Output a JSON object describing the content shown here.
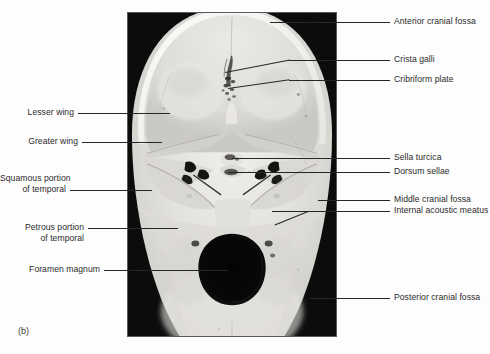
{
  "figure": {
    "caption": "(b)",
    "image_name": "skull-interior-cranial-base-superior-view"
  },
  "labels_right": [
    {
      "text": "Anterior cranial fossa",
      "name": "label-anterior-cranial-fossa"
    },
    {
      "text": "Crista galli",
      "name": "label-crista-galli"
    },
    {
      "text": "Cribriform plate",
      "name": "label-cribriform-plate"
    },
    {
      "text": "Sella turcica",
      "name": "label-sella-turcica"
    },
    {
      "text": "Dorsum sellae",
      "name": "label-dorsum-sellae"
    },
    {
      "text": "Middle cranial fossa",
      "name": "label-middle-cranial-fossa"
    },
    {
      "text": "Internal acoustic meatus",
      "name": "label-internal-acoustic-meatus"
    },
    {
      "text": "Posterior cranial fossa",
      "name": "label-posterior-cranial-fossa"
    }
  ],
  "labels_left": [
    {
      "line1": "Lesser wing",
      "line2": "",
      "name": "label-lesser-wing"
    },
    {
      "line1": "Greater wing",
      "line2": "",
      "name": "label-greater-wing"
    },
    {
      "line1": "Squamous portion",
      "line2": "of temporal",
      "name": "label-squamous-portion-of-temporal"
    },
    {
      "line1": "Petrous portion",
      "line2": "of temporal",
      "name": "label-petrous-portion-of-temporal"
    },
    {
      "line1": "Foramen magnum",
      "line2": "",
      "name": "label-foramen-magnum"
    }
  ],
  "colors": {
    "leader_line": "#262626",
    "label_text": "#2b2b2b",
    "photo_border": "#5a5a5a",
    "page_background": "#fdfdfd"
  }
}
